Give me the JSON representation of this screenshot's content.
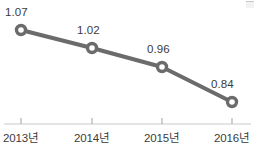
{
  "chart_data": {
    "type": "line",
    "title": "",
    "xlabel": "",
    "ylabel": "",
    "categories": [
      "2013년",
      "2014년",
      "2015년",
      "2016년"
    ],
    "values": [
      1.07,
      1.02,
      0.96,
      0.84
    ],
    "value_labels": [
      "1.07",
      "1.02",
      "0.96",
      "0.84"
    ],
    "ylim": [
      0.78,
      1.12
    ],
    "grid": false,
    "legend": false,
    "legend_position": "none",
    "series": [
      {
        "name": "",
        "values": [
          1.07,
          1.02,
          0.96,
          0.84
        ]
      }
    ],
    "style": {
      "line_color": "#6b6b6b",
      "line_width": 4,
      "marker": "circle-open",
      "marker_fill": "#ffffff",
      "marker_edge_color": "#6b6b6b",
      "marker_size": 9,
      "axis_color": "#c9c9c9",
      "tick_color": "#b0b0b0",
      "label_color": "#3b3b3b",
      "background": "#ffffff"
    },
    "points": [
      {
        "x": 21,
        "y": 30,
        "label": "1.07",
        "category": "2013년",
        "label_x": 5,
        "label_y": 7
      },
      {
        "x": 92,
        "y": 48,
        "label": "1.02",
        "category": "2014년",
        "label_x": 77,
        "label_y": 25
      },
      {
        "x": 162,
        "y": 67,
        "label": "0.96",
        "category": "2015년",
        "label_x": 147,
        "label_y": 44
      },
      {
        "x": 232,
        "y": 102,
        "label": "0.84",
        "category": "2016년",
        "label_x": 211,
        "label_y": 79
      }
    ],
    "axis": {
      "y": 124,
      "x_start": 4,
      "x_end": 251,
      "tick_height": 6
    },
    "category_positions": [
      21,
      92,
      162,
      232
    ]
  }
}
